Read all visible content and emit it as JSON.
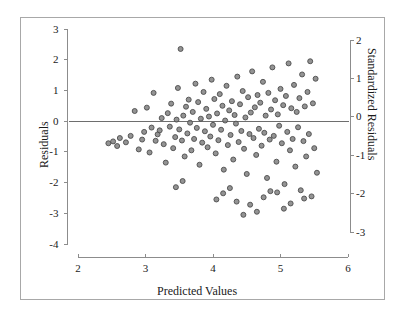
{
  "figure": {
    "background_color": "#ffffff",
    "frame_color": "#a8a8a8",
    "point_fill": "#808080",
    "point_stroke": "#4d4d4d",
    "axis_color": "#8c8c8c",
    "refline_color": "#6e6e6e",
    "text_color": "#1a1a1a"
  },
  "chart_data": {
    "type": "scatter",
    "title": "",
    "xlabel": "Predicted Values",
    "ylabel": "Residuals",
    "y2label": "Standardized Residuals",
    "xlim": [
      2,
      6
    ],
    "ylim": [
      -4,
      3
    ],
    "y2lim": [
      -3.2,
      2.2
    ],
    "xticks": [
      2,
      3,
      4,
      5,
      6
    ],
    "xticklabels": [
      "2",
      "3",
      "4",
      "5",
      "6"
    ],
    "yticks": [
      3,
      2,
      1,
      0,
      -1,
      -2,
      -3,
      -4
    ],
    "yticklabels": [
      "3",
      "2",
      "1",
      "0",
      "-1",
      "-2",
      "-3",
      "-4"
    ],
    "y2ticks": [
      2,
      1,
      0,
      -1,
      -2,
      -3
    ],
    "y2ticklabels": [
      "2",
      "1",
      "0",
      "-1",
      "-2",
      "-3"
    ],
    "grid": false,
    "legend": null,
    "reference_lines": [
      {
        "orientation": "horizontal",
        "y": 0,
        "label": "zero-residual-line"
      }
    ],
    "marker": {
      "shape": "circle",
      "size": 5,
      "fill": "#808080",
      "edge": "#4d4d4d",
      "alpha": 0.85
    },
    "n_points": 320,
    "points": [
      [
        2.45,
        -0.72
      ],
      [
        2.52,
        -0.66
      ],
      [
        2.58,
        -0.81
      ],
      [
        2.62,
        -0.55
      ],
      [
        2.71,
        -0.69
      ],
      [
        2.78,
        -0.48
      ],
      [
        2.84,
        0.33
      ],
      [
        2.9,
        -0.92
      ],
      [
        2.95,
        -0.6
      ],
      [
        2.98,
        -0.35
      ],
      [
        3.02,
        0.44
      ],
      [
        3.06,
        -1.02
      ],
      [
        3.09,
        -0.21
      ],
      [
        3.12,
        0.92
      ],
      [
        3.15,
        -0.64
      ],
      [
        3.18,
        -0.43
      ],
      [
        3.21,
        -0.3
      ],
      [
        3.24,
        0.1
      ],
      [
        3.27,
        -0.75
      ],
      [
        3.3,
        -1.35
      ],
      [
        3.33,
        0.26
      ],
      [
        3.36,
        -0.18
      ],
      [
        3.38,
        0.57
      ],
      [
        3.41,
        -0.88
      ],
      [
        3.44,
        -0.52
      ],
      [
        3.46,
        0.05
      ],
      [
        3.48,
        1.08
      ],
      [
        3.5,
        -0.27
      ],
      [
        3.52,
        2.35
      ],
      [
        3.54,
        -0.63
      ],
      [
        3.56,
        0.18
      ],
      [
        3.58,
        -1.15
      ],
      [
        3.6,
        0.47
      ],
      [
        3.62,
        -0.4
      ],
      [
        3.64,
        0.7
      ],
      [
        3.66,
        -0.05
      ],
      [
        3.68,
        -0.95
      ],
      [
        3.7,
        0.3
      ],
      [
        3.72,
        -0.58
      ],
      [
        3.74,
        1.22
      ],
      [
        3.76,
        -0.22
      ],
      [
        3.78,
        0.62
      ],
      [
        3.8,
        -1.42
      ],
      [
        3.82,
        0.08
      ],
      [
        3.84,
        -0.7
      ],
      [
        3.86,
        0.95
      ],
      [
        3.88,
        -0.33
      ],
      [
        3.9,
        0.4
      ],
      [
        3.92,
        -0.85
      ],
      [
        3.94,
        0.15
      ],
      [
        3.96,
        -0.5
      ],
      [
        3.98,
        1.35
      ],
      [
        4.0,
        -0.12
      ],
      [
        4.02,
        0.72
      ],
      [
        4.04,
        -1.05
      ],
      [
        4.06,
        0.25
      ],
      [
        4.08,
        -0.62
      ],
      [
        4.1,
        0.88
      ],
      [
        4.12,
        -0.28
      ],
      [
        4.14,
        0.5
      ],
      [
        4.16,
        -1.58
      ],
      [
        4.18,
        0.02
      ],
      [
        4.2,
        1.15
      ],
      [
        4.22,
        -0.78
      ],
      [
        4.24,
        0.35
      ],
      [
        4.26,
        -0.45
      ],
      [
        4.28,
        0.65
      ],
      [
        4.3,
        -1.25
      ],
      [
        4.32,
        0.2
      ],
      [
        4.34,
        -0.08
      ],
      [
        4.36,
        1.45
      ],
      [
        4.38,
        -0.68
      ],
      [
        4.4,
        0.55
      ],
      [
        4.42,
        -0.32
      ],
      [
        4.44,
        0.98
      ],
      [
        4.46,
        -0.9
      ],
      [
        4.48,
        0.12
      ],
      [
        4.5,
        -1.72
      ],
      [
        4.52,
        0.78
      ],
      [
        4.54,
        -0.42
      ],
      [
        4.56,
        0.28
      ],
      [
        4.58,
        1.62
      ],
      [
        4.6,
        -0.55
      ],
      [
        4.62,
        0.45
      ],
      [
        4.64,
        -1.1
      ],
      [
        4.66,
        0.85
      ],
      [
        4.68,
        -0.25
      ],
      [
        4.7,
        0.6
      ],
      [
        4.72,
        -0.8
      ],
      [
        4.74,
        1.28
      ],
      [
        4.76,
        -0.38
      ],
      [
        4.78,
        0.18
      ],
      [
        4.8,
        -1.85
      ],
      [
        4.82,
        0.92
      ],
      [
        4.84,
        -0.6
      ],
      [
        4.86,
        0.38
      ],
      [
        4.88,
        1.75
      ],
      [
        4.9,
        -0.48
      ],
      [
        4.92,
        0.68
      ],
      [
        4.94,
        -1.32
      ],
      [
        4.96,
        0.22
      ],
      [
        4.98,
        -0.15
      ],
      [
        5.0,
        1.05
      ],
      [
        5.02,
        -0.72
      ],
      [
        5.04,
        0.52
      ],
      [
        5.06,
        -2.05
      ],
      [
        5.08,
        0.82
      ],
      [
        5.1,
        -0.35
      ],
      [
        5.12,
        1.88
      ],
      [
        5.14,
        -0.95
      ],
      [
        5.16,
        0.42
      ],
      [
        5.18,
        -0.58
      ],
      [
        5.2,
        1.18
      ],
      [
        5.22,
        -1.48
      ],
      [
        5.24,
        0.3
      ],
      [
        5.26,
        -0.2
      ],
      [
        5.28,
        0.75
      ],
      [
        5.3,
        -2.25
      ],
      [
        5.32,
        1.52
      ],
      [
        5.34,
        -0.65
      ],
      [
        5.36,
        0.48
      ],
      [
        5.38,
        -1.15
      ],
      [
        5.4,
        0.95
      ],
      [
        5.42,
        -0.42
      ],
      [
        5.44,
        1.95
      ],
      [
        5.46,
        -2.45
      ],
      [
        5.48,
        0.58
      ],
      [
        5.5,
        -0.88
      ],
      [
        5.52,
        1.38
      ],
      [
        5.54,
        -1.68
      ],
      [
        4.05,
        -2.55
      ],
      [
        4.35,
        -2.62
      ],
      [
        4.55,
        -2.72
      ],
      [
        4.15,
        -2.35
      ],
      [
        3.55,
        -1.95
      ],
      [
        4.75,
        -2.48
      ],
      [
        5.05,
        -2.85
      ],
      [
        4.95,
        -2.32
      ],
      [
        4.25,
        -2.18
      ],
      [
        4.65,
        -2.95
      ],
      [
        3.45,
        -2.15
      ],
      [
        5.15,
        -2.68
      ],
      [
        4.45,
        -3.05
      ],
      [
        4.85,
        -2.28
      ],
      [
        5.35,
        -2.52
      ]
    ]
  }
}
